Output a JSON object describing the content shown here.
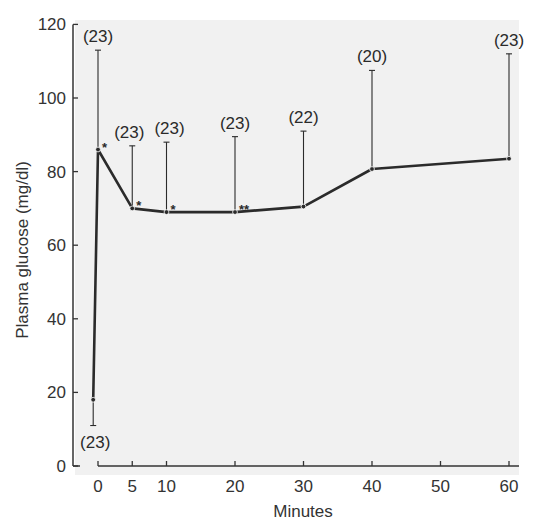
{
  "chart_data": {
    "type": "line",
    "title": "",
    "xlabel": "Minutes",
    "ylabel": "Plasma glucose (mg/dl)",
    "xlim": [
      -1,
      61
    ],
    "ylim": [
      0,
      120
    ],
    "x_ticks": [
      0,
      5,
      10,
      20,
      30,
      40,
      50,
      60
    ],
    "y_ticks": [
      0,
      20,
      40,
      60,
      80,
      100,
      120
    ],
    "grid": false,
    "legend": null,
    "series": [
      {
        "name": "Plasma glucose",
        "points": [
          {
            "x": -0.7,
            "y": 18,
            "error_end": 11,
            "error_direction": "down",
            "n": "(23)",
            "sig": ""
          },
          {
            "x": 0,
            "y": 86,
            "error_end": 113,
            "error_direction": "up",
            "n": "(23)",
            "sig": "*"
          },
          {
            "x": 5,
            "y": 70,
            "error_end": 87,
            "error_direction": "up",
            "n": "(23)",
            "sig": "*"
          },
          {
            "x": 10,
            "y": 69,
            "error_end": 88,
            "error_direction": "up",
            "n": "(23)",
            "sig": "*"
          },
          {
            "x": 20,
            "y": 69,
            "error_end": 89.5,
            "error_direction": "up",
            "n": "(23)",
            "sig": "**"
          },
          {
            "x": 30,
            "y": 70.5,
            "error_end": 91,
            "error_direction": "up",
            "n": "(22)",
            "sig": ""
          },
          {
            "x": 40,
            "y": 80.7,
            "error_end": 107.5,
            "error_direction": "up",
            "n": "(20)",
            "sig": ""
          },
          {
            "x": 60,
            "y": 83.5,
            "error_end": 112,
            "error_direction": "up",
            "n": "(23)",
            "sig": ""
          }
        ]
      }
    ]
  },
  "colors": {
    "plot_background": "#f1f1f1",
    "line": "#2b2b2b",
    "axis": "#333333"
  }
}
